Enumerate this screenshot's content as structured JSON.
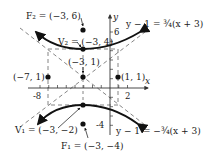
{
  "figure": {
    "axes": {
      "x_label": "x",
      "y_label": "y",
      "x_ticks_labeled": [
        "-8",
        "2"
      ],
      "y_ticks_labeled": [
        "6",
        "-4"
      ]
    },
    "points": {
      "F2": "F₂ = (−3, 6)",
      "V2": "V₂ = (−3, 4)",
      "center": "(−3, 1)",
      "left": "(−7, 1)",
      "right": "(1, 1)",
      "V1": "V₁ = (−3, −2)",
      "F1": "F₁ = (−3, −4)"
    },
    "asymptotes": {
      "upper": "y − 1 = ¾(x + 3)",
      "lower": "y − 1 = −¾(x + 3)"
    },
    "colors": {
      "curve": "#111111",
      "dashed": "#666666",
      "axis": "#333333"
    }
  }
}
